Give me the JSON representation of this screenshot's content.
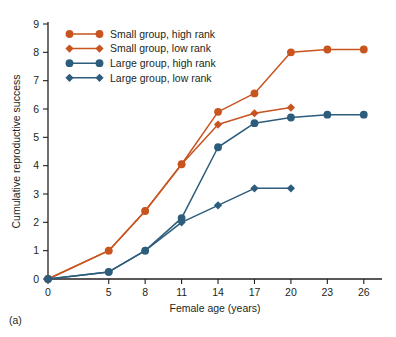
{
  "figure": {
    "panel_label": "(a)"
  },
  "chart_data": {
    "type": "line",
    "title": "",
    "xlabel": "Female age (years)",
    "ylabel": "Cumulative reproductive success",
    "x": [
      0,
      5,
      8,
      11,
      14,
      17,
      20,
      23,
      26
    ],
    "xticks": [
      "0",
      "5",
      "8",
      "11",
      "14",
      "17",
      "20",
      "23",
      "26"
    ],
    "yticks": [
      "0",
      "1",
      "2",
      "3",
      "4",
      "5",
      "6",
      "7",
      "8",
      "9"
    ],
    "xlim": [
      0,
      27.5
    ],
    "ylim": [
      0,
      9
    ],
    "grid": false,
    "legend_position": "top-left",
    "series": [
      {
        "name": "Small group, high rank",
        "color": "#C8541F",
        "marker": "circle",
        "x": [
          0,
          5,
          8,
          11,
          14,
          17,
          20,
          23,
          26
        ],
        "values": [
          0,
          1.0,
          2.4,
          4.05,
          5.9,
          6.55,
          8.0,
          8.1,
          8.1
        ]
      },
      {
        "name": "Small group, low rank",
        "color": "#C8541F",
        "marker": "diamond",
        "x": [
          0,
          5,
          8,
          11,
          14,
          17,
          20
        ],
        "values": [
          0,
          1.0,
          2.4,
          4.05,
          5.45,
          5.85,
          6.05
        ]
      },
      {
        "name": "Large group, high rank",
        "color": "#2C5D7C",
        "marker": "circle",
        "x": [
          0,
          5,
          8,
          11,
          14,
          17,
          20,
          23,
          26
        ],
        "values": [
          0,
          0.25,
          1.0,
          2.15,
          4.65,
          5.5,
          5.7,
          5.8,
          5.8
        ]
      },
      {
        "name": "Large group, low rank",
        "color": "#2C5D7C",
        "marker": "diamond",
        "x": [
          0,
          5,
          8,
          11,
          14,
          17,
          20
        ],
        "values": [
          0,
          0.25,
          1.0,
          2.0,
          2.6,
          3.2,
          3.2
        ]
      }
    ]
  },
  "legend": {
    "items": [
      {
        "label": "Small group, high rank",
        "color": "#C8541F",
        "marker": "circle"
      },
      {
        "label": "Small group, low rank",
        "color": "#C8541F",
        "marker": "diamond"
      },
      {
        "label": "Large group, high rank",
        "color": "#2C5D7C",
        "marker": "circle"
      },
      {
        "label": "Large group, low rank",
        "color": "#2C5D7C",
        "marker": "diamond"
      }
    ]
  }
}
